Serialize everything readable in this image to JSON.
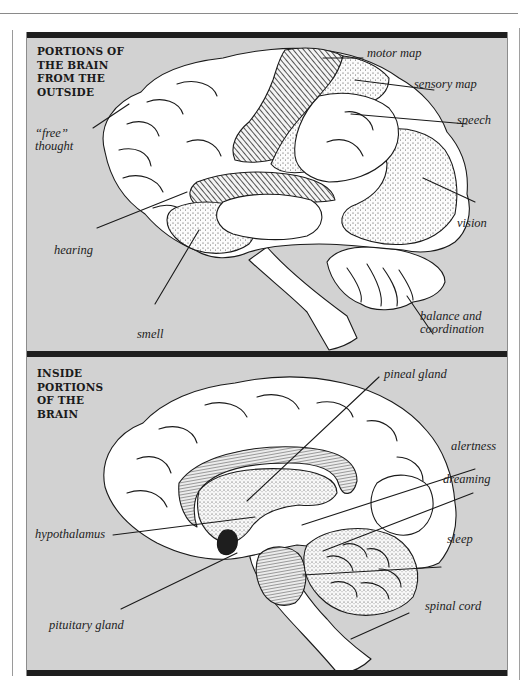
{
  "figure": {
    "colors": {
      "panel_background": "#d2d2d2",
      "panel_bar": "#1e1e1e",
      "brain_fill": "#ffffff",
      "outline": "#1a1a1a"
    },
    "top_panel": {
      "heading": "PORTIONS OF\nTHE BRAIN\nFROM THE\nOUTSIDE",
      "labels": {
        "free_thought": "“free”\nthought",
        "motor_map": "motor map",
        "sensory_map": "sensory map",
        "speech": "speech",
        "vision": "vision",
        "hearing": "hearing",
        "smell": "smell",
        "balance": "balance and\ncoordination"
      }
    },
    "bottom_panel": {
      "heading": "INSIDE\nPORTIONS\nOF THE\nBRAIN",
      "labels": {
        "pineal_gland": "pineal gland",
        "alertness": "alertness",
        "dreaming": "dreaming",
        "hypothalamus": "hypothalamus",
        "sleep": "sleep",
        "spinal_cord": "spinal cord",
        "pituitary_gland": "pituitary gland"
      }
    }
  }
}
